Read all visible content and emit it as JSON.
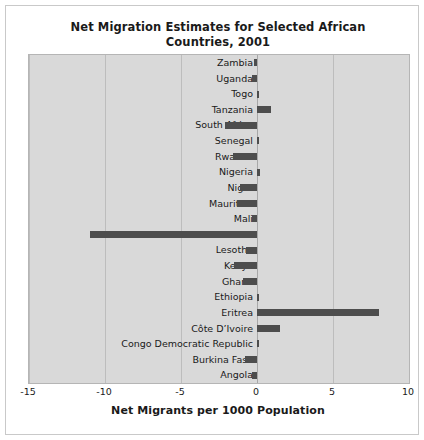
{
  "figure": {
    "title": "Net Migration Estimates for Selected African Countries, 2001",
    "title_line1": "Net Migration Estimates for Selected African",
    "title_line2": "Countries, 2001",
    "background_color": "#ffffff",
    "plot_background_color": "#d9d9d9",
    "bar_color": "#4d4d4d",
    "gridline_color": "#bdbdbd"
  },
  "chart_data": {
    "type": "bar",
    "orientation": "horizontal",
    "title": "Net Migration Estimates for Selected African Countries, 2001",
    "xlabel": "Net Migrants per 1000 Population",
    "ylabel": "",
    "xlim": [
      -15,
      10
    ],
    "xticks": [
      -15,
      -10,
      -5,
      0,
      5,
      10
    ],
    "xticklabels": [
      "-15",
      "-10",
      "-5",
      "0",
      "5",
      "10"
    ],
    "grid": true,
    "legend": false,
    "categories": [
      "Zambia",
      "Uganda",
      "Togo",
      "Tanzania",
      "South Africa",
      "Senegal",
      "Rwanda",
      "Nigeria",
      "Niger",
      "Mauritius",
      "Mali",
      "Liberia",
      "Lesotho",
      "Kenya",
      "Ghana",
      "Ethiopia",
      "Eritrea",
      "Côte D’Ivoire",
      "Congo Democratic Republic",
      "Burkina Faso",
      "Angola"
    ],
    "values": [
      -0.2,
      -0.3,
      0.1,
      0.9,
      -2.1,
      0.1,
      -1.6,
      0.2,
      -1.1,
      -1.3,
      -0.3,
      -11.0,
      -0.7,
      -1.5,
      -0.9,
      0.1,
      8.0,
      1.5,
      0.1,
      -0.8,
      -0.3
    ]
  }
}
